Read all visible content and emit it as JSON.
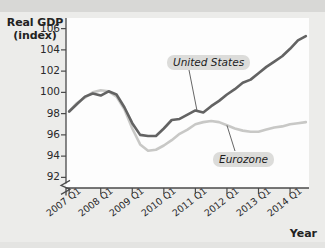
{
  "chart_data": {
    "type": "line",
    "title": "",
    "ylabel_line1": "Real GDP",
    "ylabel_line2": "(index)",
    "xlabel": "Year",
    "ylim": [
      91,
      107
    ],
    "yticks": [
      92,
      94,
      96,
      98,
      100,
      102,
      104,
      106
    ],
    "y_axis_break": true,
    "grid": false,
    "legend_position": "inline-callouts",
    "x_tick_labels": [
      "2007 Q1",
      "2008 Q1",
      "2009 Q1",
      "2010 Q1",
      "2011 Q1",
      "2012 Q1",
      "2013 Q1",
      "2014 Q1"
    ],
    "x_tick_values": [
      2007.0,
      2008.0,
      2009.0,
      2010.0,
      2011.0,
      2012.0,
      2013.0,
      2014.0
    ],
    "xlim": [
      2006.9,
      2014.6
    ],
    "series": [
      {
        "name": "United States",
        "color": "#636363",
        "annotation": "United States",
        "x": [
          2007.0,
          2007.25,
          2007.5,
          2007.75,
          2008.0,
          2008.25,
          2008.5,
          2008.75,
          2009.0,
          2009.25,
          2009.5,
          2009.75,
          2010.0,
          2010.25,
          2010.5,
          2010.75,
          2011.0,
          2011.25,
          2011.5,
          2011.75,
          2012.0,
          2012.25,
          2012.5,
          2012.75,
          2013.0,
          2013.25,
          2013.5,
          2013.75,
          2014.0,
          2014.25,
          2014.5
        ],
        "values": [
          98.2,
          98.9,
          99.6,
          99.9,
          99.7,
          100.1,
          99.8,
          98.6,
          97.1,
          96.0,
          95.9,
          95.9,
          96.6,
          97.4,
          97.5,
          97.9,
          98.3,
          98.1,
          98.7,
          99.2,
          99.8,
          100.3,
          100.9,
          101.2,
          101.8,
          102.4,
          102.9,
          103.4,
          104.1,
          104.9,
          105.3
        ]
      },
      {
        "name": "Eurozone",
        "color": "#c8c8c6",
        "annotation": "Eurozone",
        "x": [
          2007.0,
          2007.25,
          2007.5,
          2007.75,
          2008.0,
          2008.25,
          2008.5,
          2008.75,
          2009.0,
          2009.25,
          2009.5,
          2009.75,
          2010.0,
          2010.25,
          2010.5,
          2010.75,
          2011.0,
          2011.25,
          2011.5,
          2011.75,
          2012.0,
          2012.25,
          2012.5,
          2012.75,
          2013.0,
          2013.25,
          2013.5,
          2013.75,
          2014.0,
          2014.25,
          2014.5
        ],
        "values": [
          98.2,
          99.0,
          99.5,
          100.0,
          100.2,
          100.1,
          99.6,
          98.4,
          96.6,
          95.1,
          94.5,
          94.6,
          95.0,
          95.5,
          96.1,
          96.5,
          97.0,
          97.2,
          97.3,
          97.2,
          96.9,
          96.6,
          96.4,
          96.3,
          96.3,
          96.5,
          96.7,
          96.8,
          97.0,
          97.1,
          97.2
        ]
      }
    ],
    "annotations": [
      {
        "text": "United States",
        "series": "United States",
        "leader_from_x": 2011.05,
        "leader_from_y": 98.3
      },
      {
        "text": "Eurozone",
        "series": "Eurozone",
        "leader_from_x": 2012.0,
        "leader_from_y": 96.9
      }
    ]
  },
  "figure": {
    "y_axis_title_line1": "Real GDP",
    "y_axis_title_line2": "(index)",
    "x_axis_title": "Year"
  }
}
